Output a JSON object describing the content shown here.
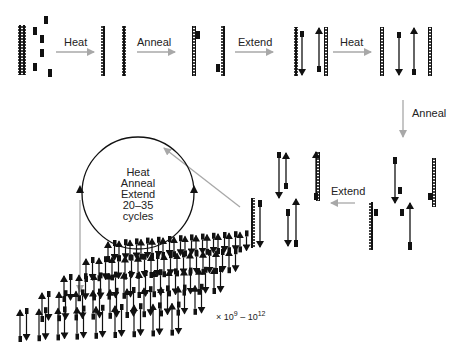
{
  "steps": {
    "heat1": "Heat",
    "anneal1": "Anneal",
    "extend1": "Extend",
    "heat2": "Heat",
    "anneal2": "Anneal",
    "extend2": "Extend"
  },
  "cycle": {
    "line1": "Heat",
    "line2": "Anneal",
    "line3": "Extend",
    "line4": "20–35",
    "line5": "cycles"
  },
  "amplification": {
    "prefix": "× 10",
    "exp1": "9",
    "dash": " – 10",
    "exp2": "12"
  },
  "colors": {
    "process_arrow": "#a8a8a8",
    "strand": "#111111"
  }
}
